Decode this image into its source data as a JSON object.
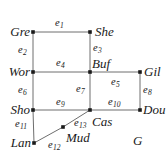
{
  "figure": {
    "name": "G",
    "width": 167,
    "height": 157,
    "background": "#ffffff",
    "edge_color": "#6e6e6e",
    "node_color": "#1a1a1a",
    "text_color": "#1a1a1a"
  },
  "nodes": [
    {
      "id": "gre",
      "label": "Gre",
      "x": 33,
      "y": 32,
      "label_x": 3,
      "label_y": 25,
      "align": "right",
      "label_w": 27
    },
    {
      "id": "she",
      "label": "She",
      "x": 90,
      "y": 32,
      "label_x": 95,
      "label_y": 25,
      "align": "left",
      "label_w": 30
    },
    {
      "id": "wor",
      "label": "Wor",
      "x": 33,
      "y": 72,
      "label_x": 0,
      "label_y": 65,
      "align": "right",
      "label_w": 30
    },
    {
      "id": "buf",
      "label": "Buf",
      "x": 90,
      "y": 72,
      "label_x": 92,
      "label_y": 57,
      "align": "left",
      "label_w": 28
    },
    {
      "id": "gil",
      "label": "Gil",
      "x": 140,
      "y": 72,
      "label_x": 144,
      "label_y": 65,
      "align": "left",
      "label_w": 22
    },
    {
      "id": "sho",
      "label": "Sho",
      "x": 33,
      "y": 110,
      "label_x": 1,
      "label_y": 103,
      "align": "right",
      "label_w": 29
    },
    {
      "id": "cas",
      "label": "Cas",
      "x": 90,
      "y": 110,
      "label_x": 92,
      "label_y": 115,
      "align": "left",
      "label_w": 27
    },
    {
      "id": "dou",
      "label": "Dou",
      "x": 140,
      "y": 110,
      "label_x": 143,
      "label_y": 103,
      "align": "left",
      "label_w": 27
    },
    {
      "id": "mud",
      "label": "Mud",
      "x": 63,
      "y": 127,
      "label_x": 66,
      "label_y": 131,
      "align": "left",
      "label_w": 32
    },
    {
      "id": "lan",
      "label": "Lan",
      "x": 34,
      "y": 143,
      "label_x": 1,
      "label_y": 136,
      "align": "right",
      "label_w": 30
    }
  ],
  "edges": [
    {
      "id": "e1",
      "label": "e",
      "sub": "1",
      "from": "gre",
      "to": "she",
      "label_x": 55,
      "label_y": 18
    },
    {
      "id": "e2",
      "label": "e",
      "sub": "2",
      "from": "gre",
      "to": "wor",
      "label_x": 18,
      "label_y": 45
    },
    {
      "id": "e3",
      "label": "e",
      "sub": "3",
      "from": "she",
      "to": "buf",
      "label_x": 93,
      "label_y": 43
    },
    {
      "id": "e4",
      "label": "e",
      "sub": "4",
      "from": "wor",
      "to": "buf",
      "label_x": 56,
      "label_y": 58
    },
    {
      "id": "e5",
      "label": "e",
      "sub": "5",
      "from": "buf",
      "to": "gil",
      "label_x": 111,
      "label_y": 77
    },
    {
      "id": "e6",
      "label": "e",
      "sub": "6",
      "from": "wor",
      "to": "sho",
      "label_x": 18,
      "label_y": 85
    },
    {
      "id": "e7",
      "label": "e",
      "sub": "7",
      "from": "buf",
      "to": "cas",
      "label_x": 76,
      "label_y": 84
    },
    {
      "id": "e8",
      "label": "e",
      "sub": "8",
      "from": "gil",
      "to": "dou",
      "label_x": 143,
      "label_y": 85
    },
    {
      "id": "e9",
      "label": "e",
      "sub": "9",
      "from": "sho",
      "to": "cas",
      "label_x": 56,
      "label_y": 97
    },
    {
      "id": "e10",
      "label": "e",
      "sub": "10",
      "from": "cas",
      "to": "dou",
      "label_x": 108,
      "label_y": 97
    },
    {
      "id": "e11",
      "label": "e",
      "sub": "11",
      "from": "sho",
      "to": "lan",
      "label_x": 15,
      "label_y": 119
    },
    {
      "id": "e12",
      "label": "e",
      "sub": "12",
      "from": "lan",
      "to": "mud",
      "label_x": 48,
      "label_y": 140
    },
    {
      "id": "e13",
      "label": "e",
      "sub": "13",
      "from": "mud",
      "to": "cas",
      "label_x": 74,
      "label_y": 118
    }
  ],
  "graph_name": {
    "text": "G",
    "x": 133,
    "y": 134
  }
}
